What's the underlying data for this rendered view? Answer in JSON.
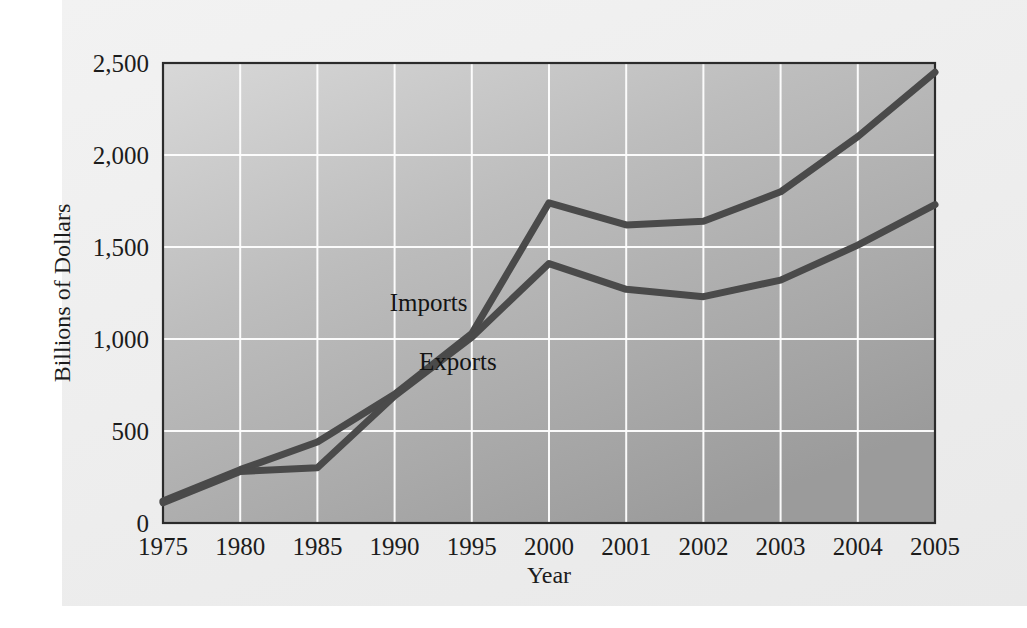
{
  "figure": {
    "background_color": "#efefef",
    "plot_gradient_from": "#d6d6d6",
    "plot_gradient_to": "#9e9e9e",
    "line_color": "#4a4a4a",
    "grid_color": "#ffffff",
    "frame_color": "#2b2b2b"
  },
  "chart_data": {
    "type": "line",
    "title": "",
    "xlabel": "Year",
    "ylabel": "Billions of Dollars",
    "x": [
      1975,
      1980,
      1985,
      1990,
      1995,
      2000,
      2001,
      2002,
      2003,
      2004,
      2005
    ],
    "categories": [
      "1975",
      "1980",
      "1985",
      "1990",
      "1995",
      "2000",
      "2001",
      "2002",
      "2003",
      "2004",
      "2005"
    ],
    "xtick_labels": [
      "1975",
      "1980",
      "1985",
      "1990",
      "1995",
      "2000",
      "2001",
      "2002",
      "2003",
      "2004",
      "2005"
    ],
    "ytick_labels": [
      "0",
      "500",
      "1,000",
      "1,500",
      "2,000",
      "2,500"
    ],
    "ytick_values": [
      0,
      500,
      1000,
      1500,
      2000,
      2500
    ],
    "ylim": [
      0,
      2500
    ],
    "xlim": [
      1975,
      2005
    ],
    "grid": true,
    "grid_axis": "both",
    "legend": "inline-annotations",
    "series": [
      {
        "name": "Imports",
        "values": [
          120,
          290,
          440,
          700,
          1030,
          1740,
          1620,
          1640,
          1800,
          2100,
          2450
        ],
        "label_x": 1992.2,
        "label_y": 1150
      },
      {
        "name": "Exports",
        "values": [
          110,
          280,
          300,
          690,
          1010,
          1410,
          1270,
          1230,
          1320,
          1510,
          1730
        ],
        "label_x": 1994.1,
        "label_y": 830
      }
    ],
    "annotations": [
      {
        "text": "Imports",
        "x": 1992.2,
        "y": 1150
      },
      {
        "text": "Exports",
        "x": 1994.1,
        "y": 830
      }
    ]
  }
}
